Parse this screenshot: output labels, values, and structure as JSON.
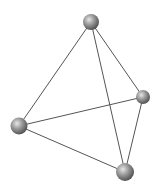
{
  "diagram": {
    "type": "tetrahedron-ball-and-stick",
    "background": "#ffffff",
    "edge_color": "#555555",
    "sphere_highlight": "#e6e6e6",
    "sphere_mid": "#9a9a9a",
    "sphere_shadow": "#4a4a4a",
    "vertices": [
      {
        "id": "top",
        "x": 91,
        "y": 22,
        "r": 8
      },
      {
        "id": "right",
        "x": 143,
        "y": 97,
        "r": 7
      },
      {
        "id": "left",
        "x": 19,
        "y": 126,
        "r": 8.5
      },
      {
        "id": "bottom",
        "x": 125,
        "y": 172,
        "r": 9
      }
    ],
    "edges": [
      [
        "top",
        "left"
      ],
      [
        "top",
        "right"
      ],
      [
        "top",
        "bottom"
      ],
      [
        "left",
        "right"
      ],
      [
        "left",
        "bottom"
      ],
      [
        "right",
        "bottom"
      ]
    ]
  }
}
